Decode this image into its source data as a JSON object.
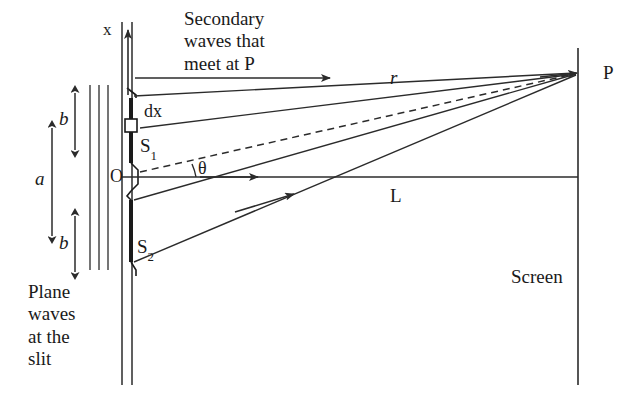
{
  "figure": {
    "labels": {
      "x_axis": "x",
      "secondary_waves": "Secondary\nwaves that\nmeet at P",
      "secondary_waves_line1": "Secondary",
      "secondary_waves_line2": "waves that",
      "secondary_waves_line3": "meet at P",
      "dx": "dx",
      "s1": "S",
      "s1_sub": "1",
      "origin": "O",
      "s2": "S",
      "s2_sub": "2",
      "slit_width_a": "a",
      "half_width_top_b": "b",
      "half_width_bottom_b": "b",
      "theta": "θ",
      "r": "r",
      "L": "L",
      "P": "P",
      "plane_waves": "Plane\nwaves\nat the\nslit",
      "plane_waves_line1": "Plane",
      "plane_waves_line2": "waves",
      "plane_waves_line3": "at the",
      "plane_waves_line4": "slit",
      "screen": "Screen"
    },
    "colors": {
      "ink": "#1a1a1a",
      "line": "#2b2b2b",
      "background": "#ffffff"
    },
    "geometry": {
      "barrier_x": 130,
      "screen_x": 578,
      "optical_axis_y": 177,
      "point_p": {
        "x": 578,
        "y": 73
      },
      "s1": {
        "x": 131,
        "y": 150
      },
      "s2": {
        "x": 131,
        "y": 252
      },
      "origin": {
        "x": 131,
        "y": 177
      },
      "dx_element": {
        "x": 130,
        "y": 125,
        "w": 11,
        "h": 13
      },
      "plane_wave_lines_x": [
        90,
        99,
        108
      ],
      "plane_wave_span_y": [
        85,
        270
      ],
      "dim_a": {
        "x": 52,
        "y_top": 125,
        "y_bottom": 238
      },
      "dim_b_top": {
        "x": 75,
        "y_top": 90,
        "y_bottom": 152
      },
      "dim_b_bottom": {
        "x": 75,
        "y_top": 213,
        "y_bottom": 272
      }
    }
  }
}
